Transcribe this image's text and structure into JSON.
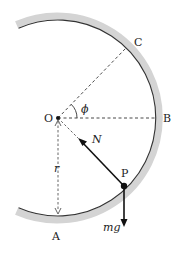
{
  "diagram": {
    "type": "physics-free-body",
    "points": {
      "O": {
        "label": "O",
        "x": 58,
        "y": 118
      },
      "A": {
        "label": "A",
        "x": 58,
        "y": 216
      },
      "B": {
        "label": "B",
        "x": 156,
        "y": 118
      },
      "C": {
        "label": "C",
        "x": 126,
        "y": 48
      },
      "P": {
        "label": "P",
        "x": 124,
        "y": 186
      }
    },
    "radius": 98,
    "labels": {
      "O": "O",
      "A": "A",
      "B": "B",
      "C": "C",
      "P": "P",
      "N": "N",
      "r": "r",
      "mg": "mg",
      "phi": "ϕ"
    },
    "colors": {
      "track_band": "#d4d4d4",
      "track_line": "#333333",
      "lines": "#222222"
    }
  }
}
